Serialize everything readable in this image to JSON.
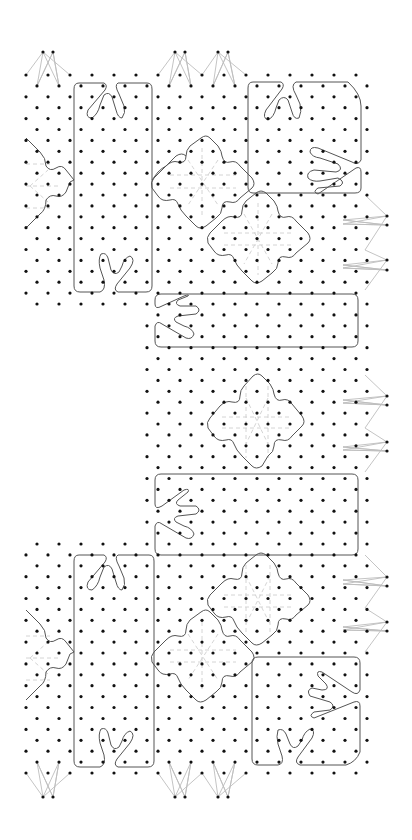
{
  "diagram": {
    "type": "bobbin lace pricking",
    "colors": {
      "background": "#ffffff",
      "pin_dot": "#111111",
      "outline": "#555555",
      "thread": "#bdbdbd",
      "dashed_guide": "#cfcfcf"
    },
    "grid": {
      "row_start_y": 75,
      "row_spacing": 10.906,
      "row_count": 65,
      "col_spacing": 22,
      "even_row_x0": 26,
      "odd_row_x0": 37,
      "cols_per_row": 16,
      "dot_radius": 1.6,
      "cutout": {
        "x_max": 142,
        "y_min": 306,
        "y_max": 542
      }
    },
    "edge_feet": [
      {
        "name": "foot-top-left",
        "dots": [
          [
            43,
            52
          ],
          [
            53,
            52
          ]
        ],
        "bases": [
          [
            26,
            75
          ],
          [
            37,
            86
          ],
          [
            59,
            86
          ],
          [
            70,
            75
          ]
        ],
        "dir": "up"
      },
      {
        "name": "foot-top-mid-1",
        "dots": [
          [
            175,
            52
          ],
          [
            185,
            52
          ]
        ],
        "bases": [
          [
            158,
            75
          ],
          [
            169,
            86
          ],
          [
            191,
            86
          ],
          [
            202,
            75
          ]
        ],
        "dir": "up"
      },
      {
        "name": "foot-top-mid-2",
        "dots": [
          [
            218,
            52
          ],
          [
            228,
            52
          ]
        ],
        "bases": [
          [
            202,
            75
          ],
          [
            213,
            86
          ],
          [
            235,
            86
          ],
          [
            246,
            75
          ]
        ],
        "dir": "up"
      },
      {
        "name": "foot-right-1",
        "dots": [
          [
            387,
            216
          ],
          [
            387,
            225
          ]
        ],
        "bases": [
          [
            365,
            195
          ],
          [
            343,
            220
          ],
          [
            343,
            224
          ],
          [
            365,
            250
          ]
        ],
        "dir": "right"
      },
      {
        "name": "foot-right-2",
        "dots": [
          [
            387,
            260
          ],
          [
            387,
            270
          ]
        ],
        "bases": [
          [
            365,
            250
          ],
          [
            343,
            265
          ],
          [
            343,
            268
          ],
          [
            365,
            290
          ]
        ],
        "dir": "right"
      },
      {
        "name": "foot-right-3",
        "dots": [
          [
            387,
            396
          ],
          [
            387,
            405
          ]
        ],
        "bases": [
          [
            365,
            375
          ],
          [
            343,
            400
          ],
          [
            343,
            403
          ],
          [
            365,
            428
          ]
        ],
        "dir": "right"
      },
      {
        "name": "foot-right-4",
        "dots": [
          [
            387,
            442
          ],
          [
            387,
            451
          ]
        ],
        "bases": [
          [
            365,
            428
          ],
          [
            343,
            447
          ],
          [
            343,
            450
          ],
          [
            365,
            472
          ]
        ],
        "dir": "right"
      },
      {
        "name": "foot-right-5",
        "dots": [
          [
            387,
            577
          ],
          [
            387,
            586
          ]
        ],
        "bases": [
          [
            365,
            555
          ],
          [
            343,
            580
          ],
          [
            343,
            584
          ],
          [
            365,
            608
          ]
        ],
        "dir": "right"
      },
      {
        "name": "foot-right-6",
        "dots": [
          [
            387,
            622
          ],
          [
            387,
            631
          ]
        ],
        "bases": [
          [
            365,
            608
          ],
          [
            343,
            627
          ],
          [
            343,
            630
          ],
          [
            365,
            652
          ]
        ],
        "dir": "right"
      },
      {
        "name": "foot-bottom-left",
        "dots": [
          [
            43,
            797
          ],
          [
            53,
            797
          ]
        ],
        "bases": [
          [
            26,
            773
          ],
          [
            37,
            762
          ],
          [
            59,
            762
          ],
          [
            70,
            773
          ]
        ],
        "dir": "down"
      },
      {
        "name": "foot-bottom-mid-1",
        "dots": [
          [
            175,
            797
          ],
          [
            185,
            797
          ]
        ],
        "bases": [
          [
            158,
            773
          ],
          [
            169,
            762
          ],
          [
            191,
            762
          ],
          [
            202,
            773
          ]
        ],
        "dir": "down"
      },
      {
        "name": "foot-bottom-mid-2",
        "dots": [
          [
            218,
            797
          ],
          [
            228,
            797
          ]
        ],
        "bases": [
          [
            202,
            773
          ],
          [
            213,
            762
          ],
          [
            235,
            762
          ],
          [
            246,
            773
          ]
        ],
        "dir": "down"
      }
    ],
    "outlines": [
      {
        "name": "panel-top-left-tall",
        "d": "M79 83 L104 83 Q108 85 105 90 L88 110 Q85 118 92 118 Q98 114 100 105 L104 95 Q109 91 112 97 L116 110 Q118 118 122 118 Q126 113 124 106 L119 94 Q114 85 118 83 L147 83 Q152 83 152 89 L152 286 Q152 292 146 292 L118 292 Q113 290 117 284 L130 268 Q136 259 130 256 Q124 258 122 266 L119 272 Q114 276 111 270 L108 258 Q106 252 101 254 Q98 259 100 268 L104 280 Q106 290 100 292 L80 292 Q74 292 74 286 L74 89 Q74 83 79 83 Z"
      },
      {
        "name": "panel-top-right",
        "d": "M253 82 L281 82 Q285 84 282 89 L266 110 Q262 118 268 120 Q274 117 276 108 L279 100 Q284 95 288 100 L292 112 Q294 120 299 118 Q302 112 300 104 L296 95 Q290 85 296 82 L348 82 Q361 94 361 106 L361 160 Q358 166 352 162 L318 148 Q310 146 310 152 Q312 157 320 158 L338 164 Q344 170 336 172 L314 170 Q306 172 308 178 Q312 182 320 181 L338 178 Q346 182 340 186 L318 188 Q312 192 318 194 L356 168 Q361 166 361 172 L361 188 Q361 193 355 193 L253 193 Q248 193 248 187 L248 88 Q248 82 253 82 Z"
      },
      {
        "name": "panel-middle-upper",
        "d": "M161 294 L352 294 Q358 294 358 300 L358 341 Q358 347 352 347 L161 347 Q155 347 155 341 L155 326 Q157 320 162 324 L186 338 Q192 340 194 334 Q192 328 184 326 L176 322 Q172 318 178 316 L196 314 Q202 310 196 306 L180 306 Q174 304 178 300 L188 296 Q190 294 184 296 L162 306 Q155 310 155 304 L155 300 Q155 294 161 294 Z"
      },
      {
        "name": "panel-middle-lower",
        "d": "M161 474 L352 474 Q358 474 358 480 L358 549 Q358 555 352 555 L161 555 Q155 555 155 549 L155 526 Q157 520 162 524 L186 538 Q192 540 194 534 Q192 528 184 526 L176 522 Q172 518 178 516 L196 514 Q202 510 196 506 L180 506 Q174 504 178 500 L188 492 Q190 488 184 490 L162 506 Q155 510 155 504 L155 480 Q155 474 161 474 Z"
      },
      {
        "name": "panel-bottom-left-tall",
        "d": "M79 555 L104 555 Q108 557 105 562 L88 582 Q85 590 92 590 Q98 586 100 577 L104 567 Q109 563 112 569 L116 582 Q118 590 122 590 Q126 585 124 578 L119 566 Q114 557 118 555 L149 555 Q154 555 154 561 L154 761 Q154 767 148 767 L118 767 Q113 765 117 759 L130 743 Q136 734 130 731 Q124 733 122 741 L119 747 Q114 751 111 745 L108 733 Q106 727 101 729 Q98 734 100 743 L104 755 Q106 765 100 767 L80 767 Q74 767 74 761 L74 561 Q74 555 79 555 Z"
      },
      {
        "name": "panel-bottom-right",
        "d": "M258 657 L354 657 Q360 657 360 663 L360 690 Q358 696 352 692 L322 672 Q316 670 318 676 L326 684 Q330 690 322 690 L312 688 Q306 690 310 696 L330 702 Q336 706 330 710 L314 712 Q308 716 314 718 L354 702 Q360 700 360 706 L360 752 Q356 762 346 765 L300 765 Q294 763 298 757 L312 738 Q316 730 310 729 Q304 732 302 740 L298 746 Q293 750 290 744 L286 734 Q283 728 278 730 Q276 736 278 744 L282 756 Q284 764 278 765 L258 765 Q252 765 252 759 L252 663 Q252 657 258 657 Z"
      },
      {
        "name": "side-lobe-top-left",
        "d": "M26 138 L40 152 Q46 158 46 166 Q50 172 56 168 Q62 164 66 170 L74 180 L70 182 L66 192 Q62 198 56 196 Q50 194 46 200 Q46 210 40 214 L26 228"
      },
      {
        "name": "side-lobe-top-right",
        "d": "M152 180 L158 172 Q162 168 166 166 L176 156 Q182 152 186 156"
      },
      {
        "name": "side-lobe-bottom-left",
        "d": "M26 610 L40 624 Q46 630 46 638 Q50 644 56 640 Q62 636 66 642 L74 652 L70 654 L66 664 Q62 670 56 668 Q50 666 46 672 Q46 682 40 686 L26 700"
      },
      {
        "name": "diamond-top-a",
        "d": "M201 138 Q206 134 210 138 L218 146 Q222 152 222 156 Q224 164 230 162 Q236 160 240 166 L252 178 Q256 184 252 188 L240 198 Q236 204 230 202 Q222 200 222 208 Q222 214 216 218 L206 226 Q200 230 196 226 L186 216 Q180 210 178 204 Q176 198 170 200 Q162 202 158 196 L152 188 Q150 182 154 178 L166 166 Q172 160 178 162 Q186 164 186 156 Q186 150 190 146 Z"
      },
      {
        "name": "diamond-top-b",
        "d": "M256 193 Q261 189 266 193 L274 201 Q278 207 278 211 Q280 219 286 217 Q292 215 296 221 L308 233 Q312 239 308 243 L296 253 Q292 259 286 257 Q278 255 278 263 Q278 269 272 273 L262 281 Q256 285 252 281 L242 271 Q236 265 234 259 Q232 253 226 255 Q218 257 214 251 L208 243 Q206 237 210 233 L222 221 Q228 215 234 217 Q242 219 242 211 Q242 205 246 201 Z"
      },
      {
        "name": "diamond-middle",
        "d": "M253 376 Q258 372 262 376 L270 384 Q274 390 274 394 Q276 402 282 400 Q288 398 292 404 L302 416 Q306 422 302 426 L292 436 Q288 442 282 440 Q274 438 274 446 Q274 452 268 456 L262 466 Q256 470 252 466 L242 456 Q236 450 234 444 Q232 438 226 440 Q218 442 214 436 L208 428 Q206 422 210 418 L220 406 Q226 400 232 402 Q240 404 240 396 Q240 390 244 386 Z"
      },
      {
        "name": "diamond-bottom-a",
        "d": "M256 555 Q261 551 266 555 L274 563 Q278 569 278 573 Q280 581 286 579 Q292 577 296 583 L308 595 Q312 601 308 605 L296 615 Q292 621 286 619 Q278 617 278 625 Q278 631 272 635 L262 643 Q256 647 252 643 L242 633 Q236 627 234 621 Q232 615 226 617 Q218 619 214 613 L208 605 Q206 599 210 595 L222 583 Q228 577 234 579 Q242 581 242 573 Q242 567 246 563 Z"
      },
      {
        "name": "diamond-bottom-b",
        "d": "M201 612 Q206 608 210 612 L218 620 Q222 626 222 630 Q224 638 230 636 Q236 634 240 640 L252 652 Q256 658 252 662 L240 672 Q236 678 230 676 Q222 674 222 682 Q222 688 216 692 L206 700 Q200 704 196 700 L186 690 Q180 684 178 678 Q176 672 170 674 Q162 676 158 670 L152 662 Q150 656 154 652 L166 640 Q172 634 178 636 Q186 638 186 630 Q186 624 190 620 Z"
      }
    ],
    "dashed_guides": [
      {
        "name": "guide-diamond-top-a",
        "d": "M170 175 L236 175 M170 188 L236 188 M202 148 L202 218 M188 160 L218 205 M218 160 L188 205"
      },
      {
        "name": "guide-diamond-top-b",
        "d": "M224 233 L292 233 M224 245 L292 245 M258 203 L258 275 M244 214 L272 264 M272 214 L244 264"
      },
      {
        "name": "guide-diamond-middle",
        "d": "M222 417 L290 417 M222 428 L290 428 M246 386 L246 458 M268 386 L268 458 M246 398 L268 444 M268 398 L246 444"
      },
      {
        "name": "guide-diamond-bottom-a",
        "d": "M224 595 L292 595 M224 607 L292 607 M246 565 L246 635 M270 565 L270 635 M246 576 L270 624 M270 576 L246 624"
      },
      {
        "name": "guide-diamond-bottom-b",
        "d": "M170 650 L236 650 M170 662 L236 662 M202 622 L202 692 M188 634 L218 680 M218 634 L188 680"
      },
      {
        "name": "guide-side-top-left",
        "d": "M26 164 L50 164 M26 186 L60 186 M26 208 L50 208 M30 186 L48 170 M30 186 L48 202"
      },
      {
        "name": "guide-side-bottom-left",
        "d": "M26 636 L50 636 M26 658 L60 658 M26 680 L50 680 M30 658 L48 642 M30 658 L48 674"
      }
    ]
  }
}
